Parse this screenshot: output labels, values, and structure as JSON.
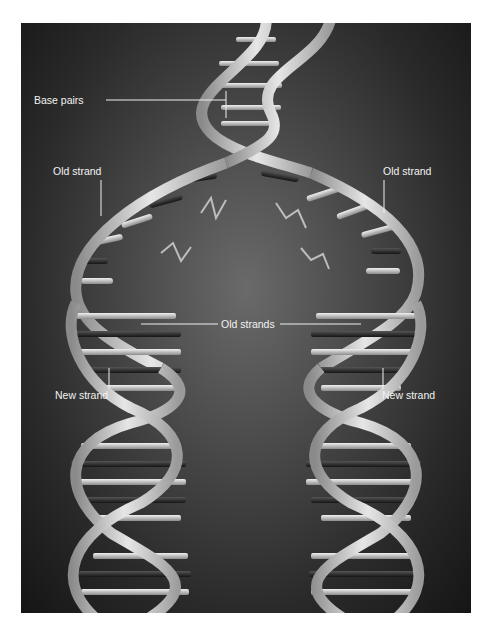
{
  "figure": {
    "background_color": "#2e2e2e",
    "strand_color": "#c8c8c8",
    "base_light": "#d9d9d9",
    "base_dark": "#2a2a2a",
    "label_color": "#f2f2f2"
  },
  "labels": {
    "base_pairs": "Base pairs",
    "old_strand_left": "Old strand",
    "old_strand_right": "Old strand",
    "old_strands": "Old strands",
    "new_strand_left": "New strand",
    "new_strand_right": "New strand"
  }
}
